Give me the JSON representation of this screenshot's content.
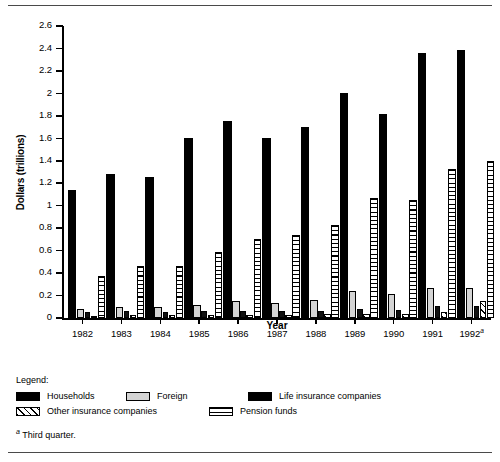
{
  "chart_data": {
    "type": "bar",
    "title": "",
    "xlabel": "Year",
    "ylabel": "Dollars (trillions)",
    "ylim": [
      0,
      2.6
    ],
    "ytick_step": 0.2,
    "yticks": [
      "0",
      "0.2",
      "0.4",
      "0.6",
      "0.8",
      "1",
      "1.2",
      "1.4",
      "1.6",
      "1.8",
      "2",
      "2.2",
      "2.4",
      "2.6"
    ],
    "grid": false,
    "legend_position": "below-plot",
    "categories": [
      "1982",
      "1983",
      "1984",
      "1985",
      "1986",
      "1987",
      "1988",
      "1989",
      "1990",
      "1991",
      "1992"
    ],
    "category_labels": [
      "1982",
      "1983",
      "1984",
      "1985",
      "1986",
      "1987",
      "1988",
      "1989",
      "1990",
      "1991",
      "1992a"
    ],
    "series": [
      {
        "name": "Households",
        "key": "households",
        "pattern": "solid-black",
        "values": [
          1.14,
          1.28,
          1.26,
          1.6,
          1.75,
          1.6,
          1.7,
          2.0,
          1.82,
          2.36,
          2.39
        ]
      },
      {
        "name": "Foreign",
        "key": "foreign",
        "pattern": "light-gray",
        "values": [
          0.08,
          0.1,
          0.1,
          0.12,
          0.15,
          0.13,
          0.16,
          0.24,
          0.21,
          0.27,
          0.27
        ]
      },
      {
        "name": "Life insurance companies",
        "key": "life",
        "pattern": "solid-black",
        "values": [
          0.05,
          0.06,
          0.05,
          0.06,
          0.06,
          0.06,
          0.06,
          0.08,
          0.07,
          0.11,
          0.11
        ]
      },
      {
        "name": "Other insurance companies",
        "key": "other",
        "pattern": "diagonal-hatch",
        "values": [
          0.02,
          0.03,
          0.03,
          0.03,
          0.03,
          0.03,
          0.04,
          0.04,
          0.04,
          0.05,
          0.15
        ]
      },
      {
        "name": "Pension funds",
        "key": "pension",
        "pattern": "horizontal-lines",
        "values": [
          0.37,
          0.46,
          0.46,
          0.59,
          0.7,
          0.74,
          0.83,
          1.07,
          1.05,
          1.33,
          1.4
        ]
      }
    ]
  },
  "axis": {
    "ylabel": "Dollars (trillions)",
    "xlabel": "Year"
  },
  "legend": {
    "title": "Legend:",
    "items": [
      {
        "label": "Households",
        "pattern": "solid-black"
      },
      {
        "label": "Foreign",
        "pattern": "light-gray"
      },
      {
        "label": "Life insurance companies",
        "pattern": "solid-black"
      },
      {
        "label": "Other insurance companies",
        "pattern": "diagonal-hatch"
      },
      {
        "label": "Pension funds",
        "pattern": "horizontal-lines"
      }
    ]
  },
  "footnote": {
    "marker": "a",
    "text": "Third quarter."
  },
  "colors": {
    "axis": "#000000",
    "households": "#000000",
    "foreign": "#d4d4d4",
    "life": "#111111",
    "other": "#ffffff",
    "pension": "#ffffff",
    "rule": "#4a4a4a"
  }
}
